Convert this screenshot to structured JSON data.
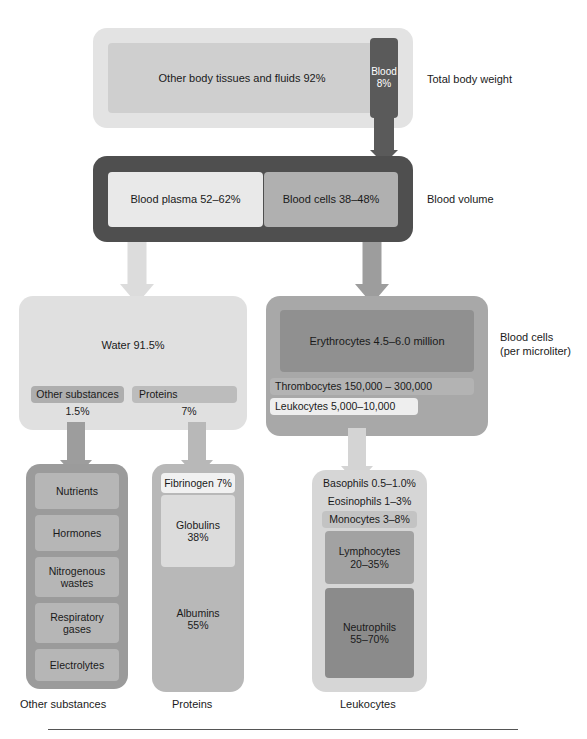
{
  "figure": {
    "row_labels": {
      "total_body_weight": "Total body weight",
      "blood_volume": "Blood volume",
      "blood_cells": "Blood cells\n(per microliter)"
    }
  },
  "total_body_weight": {
    "other_tissues": "Other body tissues and fluids 92%",
    "blood_name": "Blood",
    "blood_pct": "8%"
  },
  "blood_volume": {
    "plasma": "Blood plasma 52–62%",
    "cells": "Blood cells 38–48%"
  },
  "plasma_breakdown": {
    "water": "Water 91.5%",
    "other_substances_label": "Other substances",
    "other_substances_pct": "1.5%",
    "proteins_label": "Proteins",
    "proteins_pct": "7%"
  },
  "blood_cells_breakdown": {
    "erythrocytes": "Erythrocytes 4.5–6.0 million",
    "thrombocytes": "Thrombocytes   150,000 – 300,000",
    "leukocytes": "Leukocytes  5,000–10,000"
  },
  "other_substances_column": {
    "caption": "Other substances",
    "items": [
      "Nutrients",
      "Hormones",
      "Nitrogenous\nwastes",
      "Respiratory\ngases",
      "Electrolytes"
    ]
  },
  "proteins_column": {
    "caption": "Proteins",
    "items": [
      {
        "name": "Fibrinogen 7%"
      },
      {
        "name": "Globulins\n38%"
      },
      {
        "name": "Albumins\n55%"
      }
    ]
  },
  "leukocytes_column": {
    "caption": "Leukocytes",
    "items": [
      {
        "name": "Basophils 0.5–1.0%"
      },
      {
        "name": "Eosinophils 1–3%"
      },
      {
        "name": "Monocytes 3–8%"
      },
      {
        "name": "Lymphocytes\n20–35%"
      },
      {
        "name": "Neutrophils\n55–70%"
      }
    ]
  },
  "colors": {
    "pale": "#e9e9e9",
    "light": "#dcdcdc",
    "mid_light": "#c9c9c9",
    "mid": "#b5b5b5",
    "mid_dark": "#a3a3a3",
    "dark": "#8d8d8d",
    "darker": "#6f6f6f",
    "very_dark": "#585858",
    "frame_dark": "#4f4f4f"
  }
}
